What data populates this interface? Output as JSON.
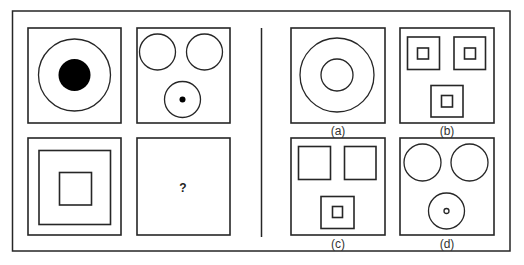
{
  "puzzle": {
    "question_mark": "?",
    "problem_figures": [
      {
        "name": "figure-1",
        "description": "large circle with filled black circle inside"
      },
      {
        "name": "figure-2",
        "description": "three circles, bottom one with small black dot"
      },
      {
        "name": "figure-3",
        "description": "large square with small square inside"
      },
      {
        "name": "figure-4",
        "description": "missing figure"
      }
    ],
    "options": [
      {
        "label": "(a)",
        "description": "large circle with smaller circle inside"
      },
      {
        "label": "(b)",
        "description": "three squares each with small square inside"
      },
      {
        "label": "(c)",
        "description": "three squares, bottom one with small square inside"
      },
      {
        "label": "(d)",
        "description": "three circles, bottom one with tiny hollow circle"
      }
    ]
  },
  "colors": {
    "stroke": "#262626",
    "fill_dark": "#000000",
    "background": "#ffffff"
  }
}
